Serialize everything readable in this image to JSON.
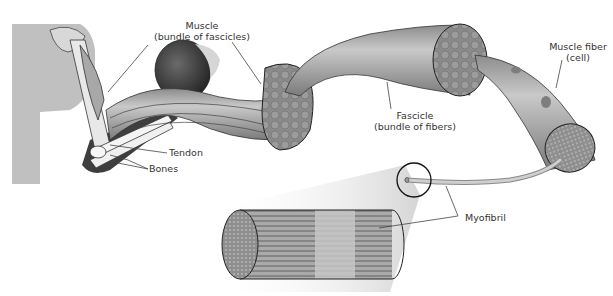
{
  "diagram": {
    "labels": {
      "muscle_line1": "Muscle",
      "muscle_line2": "(bundle of fascicles)",
      "tendon": "Tendon",
      "bones": "Bones",
      "fascicle_line1": "Fascicle",
      "fascicle_line2": "(bundle of fibers)",
      "muscle_fiber_line1": "Muscle fiber",
      "muscle_fiber_line2": "(cell)",
      "myofibril": "Myofibril"
    },
    "colors": {
      "tissue": "#9a9a9a",
      "tissue_dark": "#6e6e6e",
      "tissue_light": "#c4c4c4",
      "outline": "#222222",
      "leader_line": "#444444",
      "skin": "#bdbdbd",
      "shadow": "#4a4a4a",
      "bone": "#f2f2f2"
    }
  }
}
